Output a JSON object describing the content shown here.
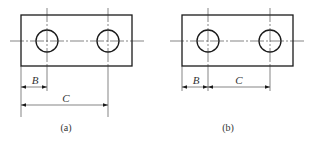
{
  "figures": [
    {
      "id": "a",
      "caption": "(a)",
      "dimension_style": "baseline",
      "dimensions": [
        {
          "label": "B",
          "from": "left-edge",
          "to": "hole-1-center"
        },
        {
          "label": "C",
          "from": "left-edge",
          "to": "hole-2-center"
        }
      ],
      "holes": 2
    },
    {
      "id": "b",
      "caption": "(b)",
      "dimension_style": "chain",
      "dimensions": [
        {
          "label": "B",
          "from": "left-edge",
          "to": "hole-1-center"
        },
        {
          "label": "C",
          "from": "hole-1-center",
          "to": "hole-2-center"
        }
      ],
      "holes": 2
    }
  ],
  "colors": {
    "line": "#1a1a1a",
    "thin": "#333333",
    "background": "#ffffff"
  }
}
